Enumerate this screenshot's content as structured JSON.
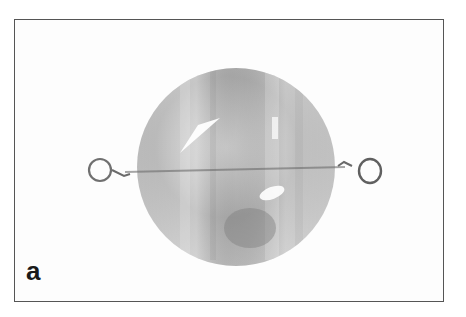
{
  "figure": {
    "panel_label": "a",
    "colors": {
      "frame": "#555555",
      "bead_light": "#cfcfcf",
      "bead_dark": "#8a8a8a",
      "wire": "#6a6a6a"
    }
  }
}
